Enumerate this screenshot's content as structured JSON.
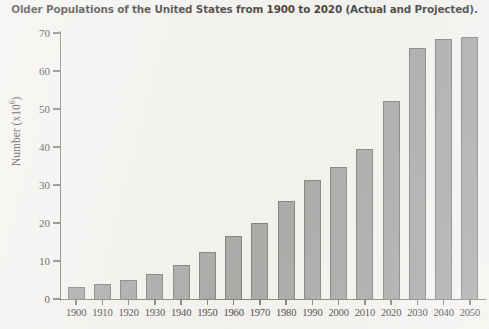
{
  "chart_data": {
    "type": "bar",
    "title": "Older Populations of the United States from 1900 to 2020 (Actual and Projected).",
    "xlabel": "",
    "ylabel": "Number (x10⁶)",
    "ylabel_base": "Number (x10",
    "ylabel_exponent": "6",
    "ylabel_close": ")",
    "categories": [
      "1900",
      "1910",
      "1920",
      "1930",
      "1940",
      "1950",
      "1960",
      "1970",
      "1980",
      "1990",
      "2000",
      "2010",
      "2020",
      "2030",
      "2040",
      "2050"
    ],
    "values": [
      3.1,
      4.0,
      4.9,
      6.7,
      9.0,
      12.3,
      16.7,
      20.1,
      25.7,
      31.2,
      34.8,
      39.4,
      52.1,
      66.0,
      68.5,
      68.9
    ],
    "ylim": [
      0,
      70
    ],
    "yticks": [
      0,
      10,
      20,
      30,
      40,
      50,
      60,
      70
    ],
    "ytick_labels": [
      "0",
      "10",
      "20",
      "30",
      "40",
      "50",
      "60",
      "70"
    ],
    "grid": false,
    "legend": "none",
    "bar_fill_color": "#9a9a98",
    "bar_edge_color": "#6d6b68",
    "axis_color": "#6f6c68",
    "background_color": "#f2f1ee",
    "text_color": "#231f1c"
  }
}
